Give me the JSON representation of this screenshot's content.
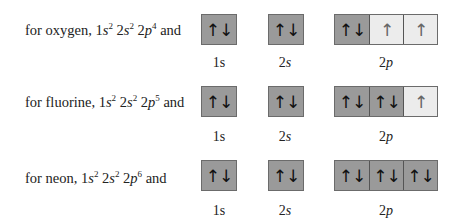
{
  "rows": [
    {
      "element": "oxygen",
      "prefix": "for oxygen, 1",
      "config_parts": [
        "s",
        "2",
        " 2",
        "s",
        "2",
        " 2",
        "p",
        "4",
        " and"
      ],
      "orbitals": {
        "s1": [
          "↑↓"
        ],
        "s2": [
          "↑↓"
        ],
        "p2": [
          "↑↓",
          "↑",
          "↑"
        ]
      },
      "p_states": [
        "filled",
        "half",
        "half"
      ]
    },
    {
      "element": "fluorine",
      "prefix": "for fluorine, 1",
      "config_parts": [
        "s",
        "2",
        " 2",
        "s",
        "2",
        " 2",
        "p",
        "5",
        " and"
      ],
      "orbitals": {
        "s1": [
          "↑↓"
        ],
        "s2": [
          "↑↓"
        ],
        "p2": [
          "↑↓",
          "↑↓",
          "↑"
        ]
      },
      "p_states": [
        "filled",
        "filled",
        "half"
      ]
    },
    {
      "element": "neon",
      "prefix": "for neon, 1",
      "config_parts": [
        "s",
        "2",
        " 2",
        "s",
        "2",
        " 2",
        "p",
        "6",
        " and"
      ],
      "orbitals": {
        "s1": [
          "↑↓"
        ],
        "s2": [
          "↑↓"
        ],
        "p2": [
          "↑↓",
          "↑↓",
          "↑↓"
        ]
      },
      "p_states": [
        "filled",
        "filled",
        "filled"
      ]
    }
  ],
  "labels": {
    "s1_num": "1",
    "s1_letter": "s",
    "s2_num": "2",
    "s2_letter": "s",
    "p2_num": "2",
    "p2_letter": "p"
  },
  "colors": {
    "filled": "#9a9a9a",
    "half": "#ececec",
    "border": "#6b6b6b"
  }
}
